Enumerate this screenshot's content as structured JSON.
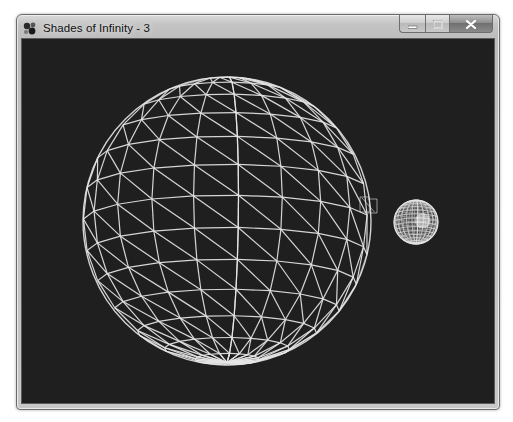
{
  "window": {
    "title": "Shades of Infinity - 3",
    "app_icon": "shades-of-infinity-app-icon",
    "buttons": {
      "minimize": {
        "icon": "minimize-icon",
        "glyph": "–"
      },
      "maximize": {
        "icon": "maximize-icon",
        "glyph": "□"
      },
      "close": {
        "icon": "close-icon",
        "glyph": "x"
      }
    }
  },
  "scene": {
    "background_color": "#1f1f1f",
    "wire_color": "#e6e6e6",
    "objects": [
      {
        "id": "large-sphere",
        "type": "wireframe-sphere",
        "center": [
          205,
          182
        ],
        "radius": 144,
        "latitude_bands": 14,
        "longitude_segments": 20,
        "rotation_deg": 0,
        "diagonals": true
      },
      {
        "id": "small-box",
        "type": "wireframe-box",
        "x": 338,
        "y": 158,
        "width": 17,
        "height": 15
      },
      {
        "id": "small-sphere",
        "type": "dense-sphere",
        "center": [
          394,
          183
        ],
        "radius": 22,
        "latitude_bands": 16,
        "longitude_segments": 24
      }
    ]
  }
}
